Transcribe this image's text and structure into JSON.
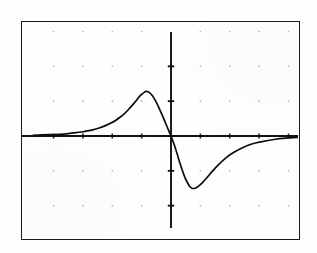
{
  "screen": {
    "title": "Graphing calculator plot screen",
    "background_color": "#fefefe",
    "frame_color": "#1a1a1a",
    "axis_color": "#111111",
    "curve_color": "#0d0d0d",
    "grid_dot_color": "#b8b8b8",
    "page_background": "#fdfdfd"
  },
  "chart_data": {
    "type": "line",
    "title": "",
    "subtitle": "",
    "xlabel": "",
    "ylabel": "",
    "grid": "dotted-points",
    "legend": "none",
    "xlim": [
      -4.7,
      4.7
    ],
    "ylim": [
      -3.1,
      3.1
    ],
    "xticks": [
      -4,
      -3,
      -2,
      -1,
      0,
      1,
      2,
      3,
      4
    ],
    "yticks": [
      -2,
      -1,
      0,
      1,
      2
    ],
    "xtick_labels": [
      "",
      "",
      "",
      "",
      "",
      "",
      "",
      "",
      ""
    ],
    "ytick_labels": [
      "",
      "",
      "",
      "",
      ""
    ],
    "axis_origin_px": {
      "x": 149,
      "y": 114
    },
    "peak": {
      "x": -0.85,
      "y": 1.28
    },
    "trough": {
      "x": 0.72,
      "y": -1.5
    },
    "series": [
      {
        "name": "curve",
        "x": [
          -4.7,
          -4.4,
          -4.1,
          -3.8,
          -3.5,
          -3.2,
          -2.95,
          -2.7,
          -2.45,
          -2.25,
          -2.05,
          -1.9,
          -1.75,
          -1.6,
          -1.45,
          -1.32,
          -1.2,
          -1.08,
          -0.98,
          -0.9,
          -0.85,
          -0.78,
          -0.7,
          -0.62,
          -0.54,
          -0.46,
          -0.38,
          -0.3,
          -0.22,
          -0.14,
          -0.06,
          0.0,
          0.08,
          0.16,
          0.24,
          0.32,
          0.4,
          0.48,
          0.56,
          0.64,
          0.72,
          0.82,
          0.94,
          1.08,
          1.24,
          1.42,
          1.62,
          1.85,
          2.1,
          2.4,
          2.75,
          3.1,
          3.5,
          3.9,
          4.3,
          4.7
        ],
        "y": [
          0.02,
          0.03,
          0.04,
          0.05,
          0.07,
          0.1,
          0.13,
          0.17,
          0.23,
          0.29,
          0.37,
          0.44,
          0.53,
          0.63,
          0.76,
          0.88,
          1.0,
          1.13,
          1.21,
          1.26,
          1.28,
          1.27,
          1.22,
          1.14,
          1.03,
          0.9,
          0.75,
          0.6,
          0.44,
          0.28,
          0.12,
          0.0,
          -0.18,
          -0.38,
          -0.6,
          -0.82,
          -1.02,
          -1.2,
          -1.34,
          -1.45,
          -1.5,
          -1.5,
          -1.44,
          -1.33,
          -1.18,
          -1.0,
          -0.82,
          -0.64,
          -0.49,
          -0.35,
          -0.23,
          -0.16,
          -0.1,
          -0.06,
          -0.04,
          -0.02
        ]
      }
    ],
    "annotations": []
  },
  "grid": {
    "dot_columns_px": [
      50,
      80,
      110,
      140,
      170,
      200,
      230,
      260,
      290
    ],
    "dot_rows_px": [
      58,
      98,
      175,
      215
    ]
  },
  "axes": {
    "x_axis_y_px": 135,
    "y_axis_x_px": 170,
    "x_tick_spacing_px": 30,
    "y_tick_spacing_px": 40
  }
}
